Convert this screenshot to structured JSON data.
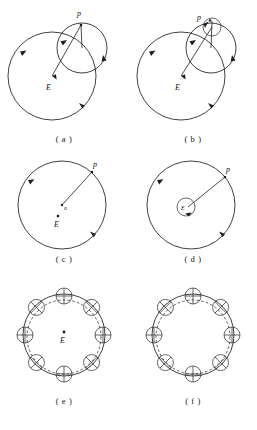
{
  "figure": {
    "panel_count": 6
  },
  "panels": [
    {
      "id": "a",
      "caption": "( a )",
      "labels": {
        "body": "p",
        "earth": "E"
      },
      "description": "Large deferent circle with epicycle circle, radius line from E to p",
      "elements": [
        "deferent-circle",
        "epicycle-circle",
        "radius-line",
        "direction-arrows"
      ]
    },
    {
      "id": "b",
      "caption": "( b )",
      "labels": {
        "body": "p",
        "earth": "E"
      },
      "description": "Deferent circle, epicycle circle and a second smaller epicycle at p",
      "elements": [
        "deferent-circle",
        "epicycle-circle",
        "minor-epicycle-circle",
        "radius-line",
        "direction-arrows"
      ]
    },
    {
      "id": "c",
      "caption": "( c )",
      "labels": {
        "body": "p",
        "earth": "E",
        "center": "o"
      },
      "description": "Eccentric circle with center o offset from Earth E, radius to p",
      "elements": [
        "eccentric-circle",
        "center-dot",
        "earth-dot",
        "radius-line",
        "direction-arrows"
      ]
    },
    {
      "id": "d",
      "caption": "( d )",
      "labels": {
        "body": "p",
        "earth": "E"
      },
      "description": "Large circle with small circle around E, radius line to p",
      "elements": [
        "deferent-circle",
        "small-center-circle",
        "radius-line",
        "direction-arrows"
      ]
    },
    {
      "id": "e",
      "caption": "( e )",
      "labels": {
        "earth": "E"
      },
      "description": "Circle with dashed circle and eight small circles spaced around the rim",
      "elements": [
        "main-circle",
        "dashed-circle",
        "rim-circles",
        "earth-dot"
      ],
      "rim_circle_count": 8
    },
    {
      "id": "f",
      "caption": "( f )",
      "labels": {},
      "description": "Circle with dashed circle and eight small circles spaced around the rim, no Earth marked",
      "elements": [
        "main-circle",
        "dashed-circle",
        "rim-circles"
      ],
      "rim_circle_count": 8
    }
  ],
  "colors": {
    "stroke": "#1e1e1e",
    "background": "#ffffff",
    "label": "#141414"
  }
}
